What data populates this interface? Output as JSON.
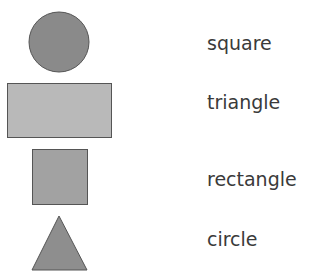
{
  "shapes": [
    {
      "name": "circle",
      "fill": "#8a8a8a"
    },
    {
      "name": "rectangle",
      "fill": "#b9b9b9"
    },
    {
      "name": "square",
      "fill": "#a2a2a2"
    },
    {
      "name": "triangle",
      "fill": "#8e8e8e"
    }
  ],
  "labels": [
    "square",
    "triangle",
    "rectangle",
    "circle"
  ]
}
